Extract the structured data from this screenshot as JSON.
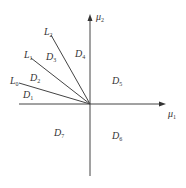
{
  "diagram": {
    "axes": {
      "x_label": {
        "main": "μ",
        "sub": "1"
      },
      "y_label": {
        "main": "μ",
        "sub": "2"
      },
      "origin": [
        90,
        104
      ]
    },
    "lines": [
      {
        "id": "L0",
        "main": "L",
        "sub": "0",
        "end": [
          19,
          83
        ]
      },
      {
        "id": "L1",
        "main": "L",
        "sub": "1",
        "end": [
          31,
          58
        ]
      },
      {
        "id": "L2",
        "main": "L",
        "sub": "2",
        "end": [
          51,
          35
        ]
      }
    ],
    "regions": [
      {
        "id": "D1",
        "main": "D",
        "sub": "1"
      },
      {
        "id": "D2",
        "main": "D",
        "sub": "2"
      },
      {
        "id": "D3",
        "main": "D",
        "sub": "3"
      },
      {
        "id": "D4",
        "main": "D",
        "sub": "4"
      },
      {
        "id": "D5",
        "main": "D",
        "sub": "5"
      },
      {
        "id": "D6",
        "main": "D",
        "sub": "6"
      },
      {
        "id": "D7",
        "main": "D",
        "sub": "7"
      }
    ],
    "colors": {
      "stroke": "#444444",
      "text": "#333333",
      "background": "#ffffff"
    }
  }
}
